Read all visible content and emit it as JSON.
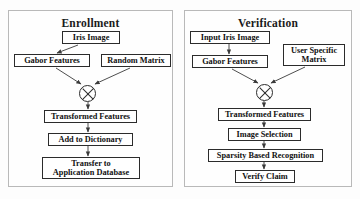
{
  "diagram": {
    "title_left": "Enrollment",
    "title_right": "Verification",
    "enrollment": {
      "iris_image": "Iris Image",
      "gabor_features": "Gabor Features",
      "random_matrix": "Random Matrix",
      "xor_operator": "⊗",
      "transformed_features": "Transformed Features",
      "add_to_dictionary": "Add to Dictionary",
      "transfer_to_application_database": "Transfer to\nApplication Database"
    },
    "verification": {
      "input_iris_image": "Input Iris Image",
      "gabor_features": "Gabor Features",
      "user_specific_matrix": "User Specific\nMatrix",
      "xor_operator": "⊗",
      "transformed_features": "Transformed Features",
      "image_selection": "Image Selection",
      "sparsity_based_recognition": "Sparsity Based Recognition",
      "verify_claim": "Verify Claim"
    },
    "colors": {
      "panel_border": "#b9b9b9",
      "node_border": "#2b2b2b",
      "text": "#111111",
      "edge": "#3a3a3a",
      "background": "#fdfdfd"
    }
  }
}
